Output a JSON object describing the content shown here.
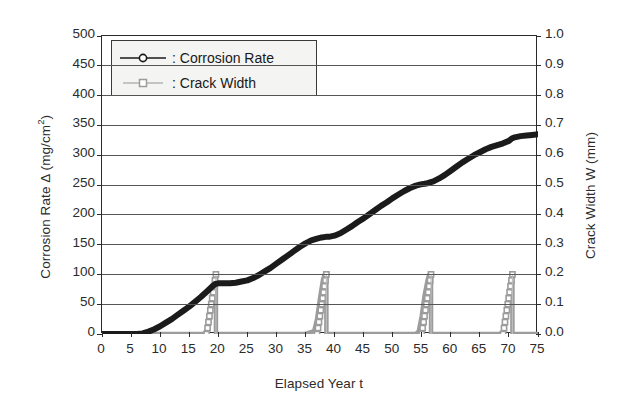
{
  "chart_data": {
    "type": "line",
    "title": "",
    "xlabel": "Elapsed Year t",
    "ylabel": "Corrosion Rate Δ (mg/cm2)",
    "ylabel_main": "Corrosion Rate Δ (mg/cm",
    "ylabel_sup": "2",
    "ylabel_tail": ")",
    "y2label": "Crack Width W (mm)",
    "xlim": [
      0,
      75
    ],
    "ylim": [
      0,
      500
    ],
    "y2lim": [
      0.0,
      1.0
    ],
    "grid": true,
    "legend_position": "upper-left-inside",
    "xticks": [
      "0",
      "5",
      "10",
      "15",
      "20",
      "25",
      "30",
      "35",
      "40",
      "45",
      "50",
      "55",
      "60",
      "65",
      "70",
      "75"
    ],
    "xtick_values": [
      0,
      5,
      10,
      15,
      20,
      25,
      30,
      35,
      40,
      45,
      50,
      55,
      60,
      65,
      70,
      75
    ],
    "yticks": [
      "0",
      "50",
      "100",
      "150",
      "200",
      "250",
      "300",
      "350",
      "400",
      "450",
      "500"
    ],
    "ytick_values": [
      0,
      50,
      100,
      150,
      200,
      250,
      300,
      350,
      400,
      450,
      500
    ],
    "y2ticks": [
      "0.0",
      "0.1",
      "0.2",
      "0.3",
      "0.4",
      "0.5",
      "0.6",
      "0.7",
      "0.8",
      "0.9",
      "1.0"
    ],
    "y2tick_values": [
      0.0,
      0.1,
      0.2,
      0.3,
      0.4,
      0.5,
      0.6,
      0.7,
      0.8,
      0.9,
      1.0
    ],
    "series": [
      {
        "name": "Corrosion Rate",
        "axis": "left",
        "color": "#1b1b1b",
        "marker": "circle",
        "x": [
          0,
          2,
          4,
          6,
          7,
          8,
          9,
          10,
          11,
          12,
          13,
          14,
          15,
          16,
          17,
          18,
          19,
          19.5,
          20,
          21,
          22,
          23,
          24,
          25,
          26,
          27,
          28,
          29,
          30,
          31,
          32,
          33,
          34,
          35,
          36,
          37,
          37.8,
          38.5,
          39,
          40,
          41,
          42,
          43,
          44,
          45,
          46,
          47,
          48,
          49,
          50,
          51,
          52,
          53,
          54,
          54.8,
          55.5,
          56,
          57,
          58,
          59,
          60,
          61,
          62,
          63,
          64,
          65,
          66,
          67,
          68,
          69,
          70,
          70.5,
          71,
          72,
          73,
          74,
          75
        ],
        "y": [
          0,
          0,
          0,
          0,
          1,
          4,
          8,
          13,
          19,
          25,
          32,
          39,
          46,
          54,
          62,
          71,
          80,
          84,
          85,
          85,
          85,
          86,
          88,
          90,
          94,
          99,
          105,
          111,
          118,
          125,
          132,
          139,
          146,
          152,
          157,
          160,
          162,
          163,
          163,
          165,
          169,
          175,
          181,
          188,
          194,
          201,
          208,
          215,
          221,
          228,
          234,
          240,
          245,
          249,
          251,
          252,
          253,
          256,
          261,
          267,
          274,
          281,
          288,
          294,
          300,
          305,
          310,
          314,
          317,
          320,
          324,
          328,
          330,
          332,
          333,
          334,
          335
        ]
      },
      {
        "name": "Crack Width",
        "axis": "right",
        "color": "#9c9c9c",
        "marker": "square",
        "x": [
          0,
          5,
          10,
          15,
          17.5,
          18,
          18.5,
          19,
          19.3,
          19.6,
          19.6,
          20,
          25,
          30,
          35,
          36.5,
          37,
          37.5,
          38,
          38.3,
          38.6,
          38.6,
          39,
          45,
          50,
          54,
          54.5,
          55,
          55.5,
          56,
          56.3,
          56.6,
          56.6,
          57,
          60,
          65,
          68.5,
          69,
          69.5,
          70,
          70.3,
          70.6,
          70.6,
          71,
          73,
          75
        ],
        "y": [
          0,
          0,
          0,
          0,
          0,
          0.01,
          0.06,
          0.13,
          0.18,
          0.2,
          0,
          0,
          0,
          0,
          0,
          0.01,
          0.05,
          0.12,
          0.18,
          0.2,
          0.2,
          0,
          0,
          0,
          0,
          0,
          0.01,
          0.06,
          0.13,
          0.18,
          0.2,
          0.2,
          0,
          0,
          0,
          0,
          0,
          0.01,
          0.06,
          0.13,
          0.18,
          0.2,
          0,
          0,
          0,
          0
        ],
        "peaks": [
          {
            "year": 19.6,
            "width_mm": 0.2
          },
          {
            "year": 38.6,
            "width_mm": 0.2
          },
          {
            "year": 56.6,
            "width_mm": 0.2
          },
          {
            "year": 70.6,
            "width_mm": 0.2
          }
        ]
      }
    ],
    "legend": [
      {
        "label": ": Corrosion Rate",
        "color": "#1b1b1b",
        "marker": "circle"
      },
      {
        "label": ": Crack Width",
        "color": "#9c9c9c",
        "marker": "square"
      }
    ]
  },
  "colors": {
    "corrosion": "#1b1b1b",
    "crack": "#9c9c9c",
    "axis": "#2a2a2a",
    "grid": "#555555",
    "background": "#ffffff",
    "legend_bg": "#f4f4f2"
  }
}
